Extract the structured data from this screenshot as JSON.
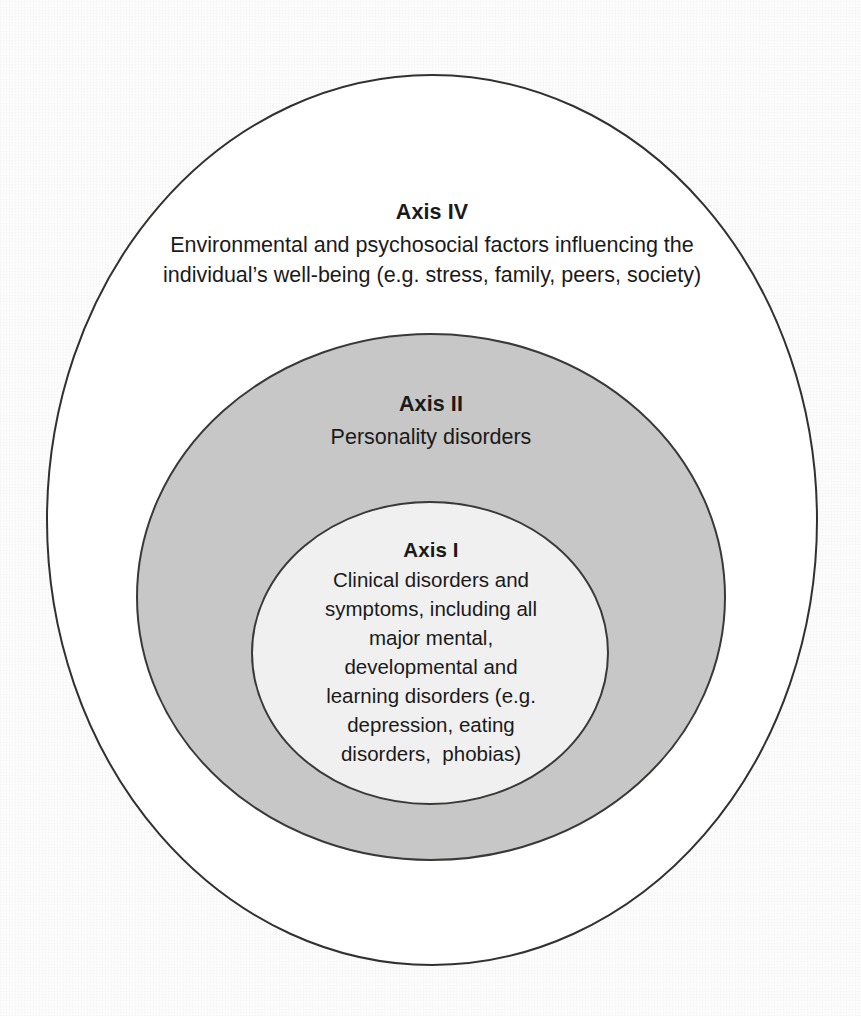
{
  "figure": {
    "type": "concentric-ellipse-diagram",
    "background_color": "#fcfcfc",
    "text_color": "#1a1a1a"
  },
  "rings": {
    "outer": {
      "name": "Axis IV",
      "fill": "#ffffff",
      "stroke": "#33312f",
      "stroke_width": 2,
      "cx": 432,
      "cy": 520,
      "rx": 385,
      "ry": 445
    },
    "middle": {
      "name": "Axis II",
      "fill": "#c7c7c7",
      "stroke": "#3b3937",
      "stroke_width": 2,
      "cx": 431,
      "cy": 597,
      "rx": 294,
      "ry": 263
    },
    "inner": {
      "name": "Axis I",
      "fill": "#f0f0f0",
      "stroke": "#3b3937",
      "stroke_width": 2,
      "cx": 430,
      "cy": 653,
      "rx": 178,
      "ry": 151
    }
  },
  "axis4": {
    "title": "Axis IV",
    "lines": [
      "Environmental and psychosocial factors influencing the",
      "individual’s well-being (e.g. stress, family, peers, society)"
    ]
  },
  "axis2": {
    "title": "Axis II",
    "lines": [
      "Personality disorders"
    ]
  },
  "axis1": {
    "title": "Axis I",
    "lines": [
      "Clinical disorders and",
      "symptoms, including all",
      "major mental,",
      "developmental and",
      "learning disorders (e.g.",
      "depression, eating",
      "disorders,  phobias)"
    ]
  }
}
